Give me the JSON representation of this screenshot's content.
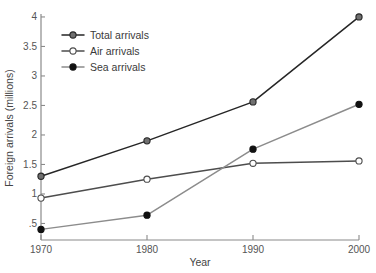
{
  "chart_data": {
    "type": "line",
    "title": "",
    "xlabel": "Year",
    "ylabel": "Foreign arrivals (millions)",
    "x": [
      1970,
      1980,
      1990,
      2000
    ],
    "xtick_labels": [
      "1970",
      "1980",
      "1990",
      "2000"
    ],
    "ytick_values": [
      0.5,
      1,
      1.5,
      2,
      2.5,
      3,
      3.5,
      4
    ],
    "ytick_labels": [
      ".5",
      "1",
      "1.5",
      "2",
      "2.5",
      "3",
      "3.5",
      "4"
    ],
    "xlim": [
      1970,
      2000
    ],
    "ylim": [
      0.22,
      4.05
    ],
    "grid": false,
    "legend_position": "upper-left-inside",
    "series": [
      {
        "name": "Total arrivals",
        "values": [
          1.3,
          1.9,
          2.56,
          4.0
        ],
        "color": "#262626",
        "marker": "filled-circle",
        "marker_fill": "#707070",
        "marker_edge": "#262626"
      },
      {
        "name": "Air arrivals",
        "values": [
          0.93,
          1.25,
          1.52,
          1.56
        ],
        "color": "#4d4d4d",
        "marker": "open-circle",
        "marker_fill": "#ffffff",
        "marker_edge": "#4d4d4d"
      },
      {
        "name": "Sea arrivals",
        "values": [
          0.4,
          0.64,
          1.76,
          2.52
        ],
        "color": "#8c8c8c",
        "marker": "filled-circle",
        "marker_fill": "#111111",
        "marker_edge": "#111111"
      }
    ]
  },
  "axes": {
    "axis_color": "#8a8a8a",
    "y_title": "Foreign arrivals (millions)",
    "x_title": "Year"
  },
  "legend": {
    "entries": [
      {
        "label": "Total arrivals"
      },
      {
        "label": "Air arrivals"
      },
      {
        "label": "Sea arrivals"
      }
    ]
  }
}
